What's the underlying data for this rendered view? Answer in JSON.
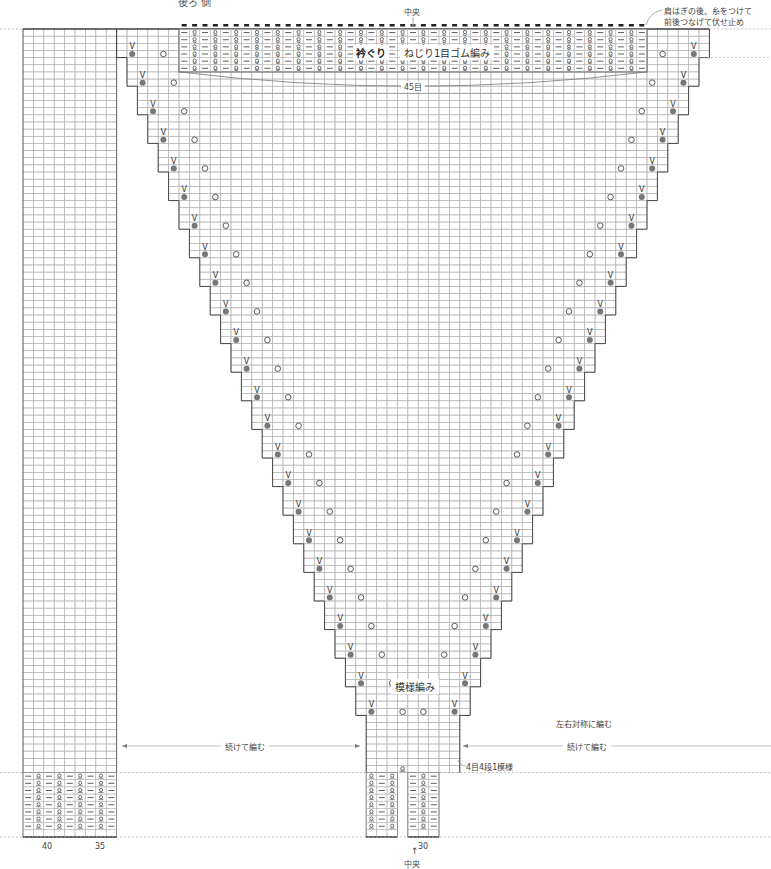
{
  "header": {
    "title_cut": "後ろ 側"
  },
  "annotations": {
    "center_top": "中央",
    "center_bottom": "中央",
    "shoulder_note_line1": "肩はぎの後、糸をつけて",
    "shoulder_note_line2": "前後つなげて伏せ止め",
    "neckband_title": "衿ぐり",
    "neckband_technique": "ねじり1目ゴム編み",
    "neckband_stitches": "45目",
    "pattern_label": "模様編み",
    "symmetric_note": "左右対称に編む",
    "continue_left": "続けて編む",
    "continue_right": "続けて編む",
    "repeat_note": "4目4段1模様"
  },
  "axis": {
    "col_40": "40",
    "col_35": "35",
    "col_30": "30"
  },
  "grid": {
    "x0": 23,
    "y0": 29,
    "cell_w": 10.4,
    "cell_h": 7.15,
    "cols": 66,
    "rows": 104,
    "left_strip_cols": 9,
    "triangle_left_start": 9,
    "triangle_right_end": 66,
    "step_rows": 4,
    "steps": 24,
    "neckband": {
      "col_start": 15,
      "cols": 45,
      "rows": 6
    },
    "rib_rows": 9,
    "colors": {
      "line": "#b5b5b5",
      "outline": "#444444",
      "dot": "#777777",
      "symbol": "#333333",
      "dash": "#aaaaaa"
    }
  }
}
